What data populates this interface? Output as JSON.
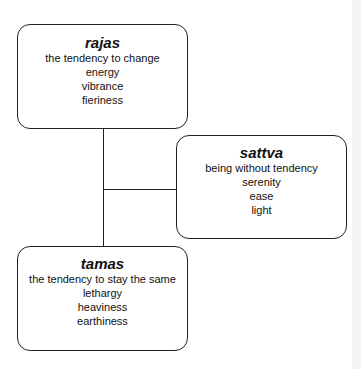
{
  "diagram": {
    "nodes": [
      {
        "id": "rajas",
        "title": "rajas",
        "lines": [
          "the tendency to change",
          "energy",
          "vibrance",
          "fieriness"
        ]
      },
      {
        "id": "sattva",
        "title": "sattva",
        "lines": [
          "being without tendency",
          "serenity",
          "ease",
          "light"
        ]
      },
      {
        "id": "tamas",
        "title": "tamas",
        "lines": [
          "the tendency to stay the same",
          "lethargy",
          "heaviness",
          "earthiness"
        ]
      }
    ],
    "edges": [
      {
        "from": "rajas",
        "to": "tamas",
        "style": "vertical line"
      },
      {
        "from": "rajas-tamas-connector",
        "to": "sattva",
        "style": "horizontal branch"
      }
    ],
    "colors": {
      "border": "#222222",
      "background": "#ffffff",
      "text": "#111111"
    }
  }
}
